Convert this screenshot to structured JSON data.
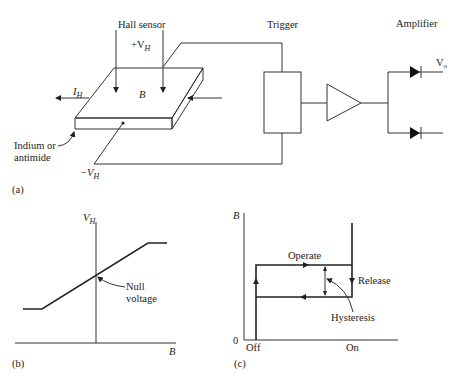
{
  "panel_a": {
    "caption": "(a)",
    "hall_sensor_label": "Hall sensor",
    "plus_vh": "+V",
    "minus_vh": "−V",
    "vh_sub": "H",
    "ih": "I",
    "ih_sub": "H",
    "b_label": "B",
    "material_line1": "Indium or",
    "material_line2": "antimide",
    "trigger_label": "Trigger",
    "amplifier_label": "Amplifier",
    "vo": "V",
    "vo_sub": "o"
  },
  "panel_b": {
    "caption": "(b)",
    "y_axis": "V",
    "y_axis_sub": "H",
    "x_axis": "B",
    "annotation_line1": "Null",
    "annotation_line2": "voltage"
  },
  "panel_c": {
    "caption": "(c)",
    "y_axis": "B",
    "origin": "0",
    "x_off": "Off",
    "x_on": "On",
    "operate": "Operate",
    "release": "Release",
    "hysteresis": "Hysteresis"
  }
}
